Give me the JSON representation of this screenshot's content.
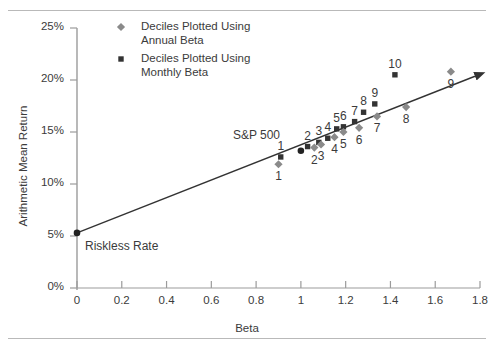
{
  "chart_data": {
    "type": "scatter",
    "title": "",
    "xlabel": "Beta",
    "ylabel": "Arithmetic Mean Return",
    "xlim": [
      0,
      1.8
    ],
    "ylim": [
      0,
      25
    ],
    "xticks": [
      "0",
      "0.2",
      "0.4",
      "0.6",
      "0.8",
      "1",
      "1.2",
      "1.4",
      "1.6",
      "1.8"
    ],
    "xtick_values": [
      0,
      0.2,
      0.4,
      0.6,
      0.8,
      1.0,
      1.2,
      1.4,
      1.6,
      1.8
    ],
    "yticks": [
      "0%",
      "5%",
      "10%",
      "15%",
      "20%",
      "25%"
    ],
    "ytick_values": [
      0,
      5,
      10,
      15,
      20,
      25
    ],
    "grid": false,
    "legend_position": "top-center",
    "legend": [
      {
        "marker": "diamond",
        "color": "#8a8a8a",
        "label_line1": "Deciles Plotted Using",
        "label_line2": "Annual Beta"
      },
      {
        "marker": "square",
        "color": "#333333",
        "label_line1": "Deciles Plotted Using",
        "label_line2": "Monthly Beta"
      }
    ],
    "series": [
      {
        "name": "Deciles Plotted Using Monthly Beta",
        "marker": "square",
        "color": "#333333",
        "label_position": "above",
        "points": [
          {
            "label": "1",
            "x": 0.91,
            "y": 12.6
          },
          {
            "label": "2",
            "x": 1.03,
            "y": 13.6
          },
          {
            "label": "3",
            "x": 1.08,
            "y": 14.0
          },
          {
            "label": "4",
            "x": 1.12,
            "y": 14.4
          },
          {
            "label": "5",
            "x": 1.16,
            "y": 15.3
          },
          {
            "label": "6",
            "x": 1.19,
            "y": 15.5
          },
          {
            "label": "7",
            "x": 1.24,
            "y": 16.0
          },
          {
            "label": "8",
            "x": 1.28,
            "y": 16.9
          },
          {
            "label": "9",
            "x": 1.33,
            "y": 17.7
          },
          {
            "label": "10",
            "x": 1.42,
            "y": 20.5
          }
        ]
      },
      {
        "name": "Deciles Plotted Using Annual Beta",
        "marker": "diamond",
        "color": "#8a8a8a",
        "label_position": "below",
        "points": [
          {
            "label": "1",
            "x": 0.9,
            "y": 11.9
          },
          {
            "label": "2",
            "x": 1.06,
            "y": 13.5
          },
          {
            "label": "3",
            "x": 1.09,
            "y": 13.8
          },
          {
            "label": "4",
            "x": 1.15,
            "y": 14.5
          },
          {
            "label": "5",
            "x": 1.19,
            "y": 15.0
          },
          {
            "label": "6",
            "x": 1.26,
            "y": 15.4
          },
          {
            "label": "7",
            "x": 1.34,
            "y": 16.5
          },
          {
            "label": "8",
            "x": 1.47,
            "y": 17.4
          },
          {
            "label": "9",
            "x": 1.67,
            "y": 20.8
          }
        ]
      },
      {
        "name": "Market Index",
        "marker": "dot",
        "color": "#222222",
        "points": [
          {
            "label": "S&P 500",
            "x": 1.0,
            "y": 13.2
          }
        ]
      },
      {
        "name": "Riskless Rate",
        "marker": "dot",
        "color": "#222222",
        "points": [
          {
            "label": "Riskless Rate",
            "x": 0.0,
            "y": 5.3
          }
        ]
      }
    ],
    "security_market_line": {
      "name": "Security Market Line",
      "from": {
        "x": 0.0,
        "y": 5.3
      },
      "to": {
        "x": 1.81,
        "y": 20.6
      },
      "arrow": true,
      "color": "#333333"
    },
    "annotations": [
      {
        "name": "sp500-label",
        "text": "S&P 500"
      },
      {
        "name": "riskless-rate-label",
        "text": "Riskless Rate"
      }
    ]
  }
}
